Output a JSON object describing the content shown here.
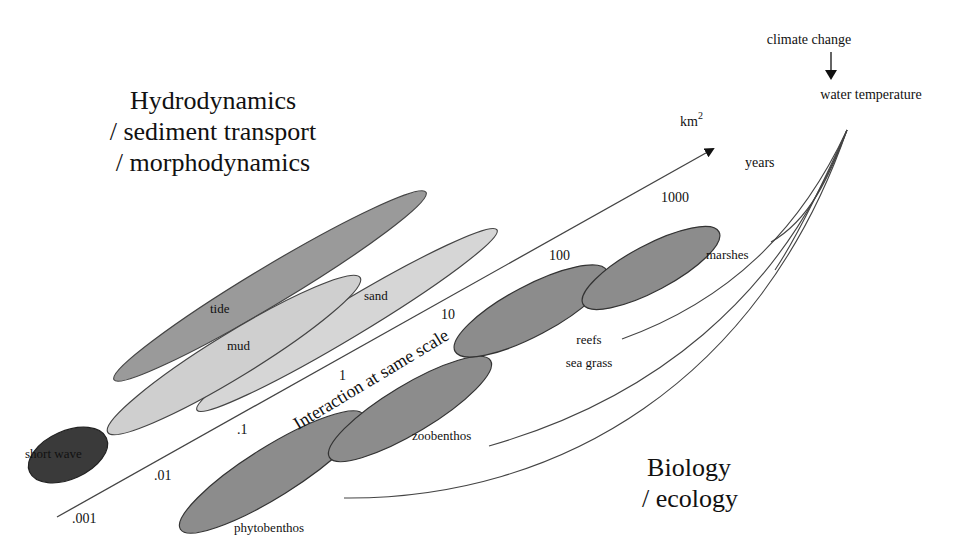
{
  "title_hydro": {
    "line1": "Hydrodynamics",
    "line2": "/ sediment transport",
    "line3": "/ morphodynamics"
  },
  "title_bio": {
    "line1": "Biology",
    "line2": "/ ecology"
  },
  "axis": {
    "unit_area": "km",
    "unit_area_exp": "2",
    "unit_time": "years",
    "ticks": [
      ".001",
      ".01",
      ".1",
      "1",
      "10",
      "100",
      "1000"
    ],
    "diagonal_label": "Interaction at same scale"
  },
  "driver": {
    "source": "climate change",
    "target": "water temperature"
  },
  "physical_processes": [
    {
      "label": "short wave",
      "shade": "#3a3a3a"
    },
    {
      "label": "tide",
      "shade": "#9a9a9a"
    },
    {
      "label": "mud",
      "shade": "#d0d0d0"
    },
    {
      "label": "sand",
      "shade": "#d6d6d6"
    }
  ],
  "biological_components": [
    {
      "label": "phytobenthos",
      "shade": "#8c8c8c"
    },
    {
      "label": "zoobenthos",
      "shade": "#8c8c8c"
    },
    {
      "label_line1": "reefs",
      "label_line2": "sea grass",
      "shade": "#8c8c8c"
    },
    {
      "label": "marshes",
      "shade": "#8c8c8c"
    }
  ]
}
